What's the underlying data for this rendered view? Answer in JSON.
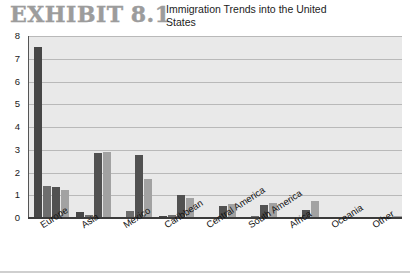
{
  "header": {
    "exhibit_label": "EXHIBIT",
    "exhibit_number": "8.1",
    "title": "Immigration Trends into the United States"
  },
  "colors": {
    "series_1900_1909": "#474747",
    "series_1950_1959": "#6e6e6e",
    "series_1990_1999": "#515151",
    "series_2000_2010": "#a2a2a2",
    "plot_background": "#e9e9e9",
    "gridline": "#b9b9b9",
    "axis": "#3b3b3b",
    "exhibit_label_color": "#9c9c9c"
  },
  "chart_data": {
    "type": "bar",
    "title": "Immigration Trends into the United States",
    "xlabel": "",
    "ylabel": "",
    "ylim": [
      0,
      8
    ],
    "yticks": [
      "0",
      "1",
      "2",
      "3",
      "4",
      "5",
      "6",
      "7",
      "8"
    ],
    "grid": true,
    "legend_position": "top-right",
    "categories": [
      "Europe",
      "Asia",
      "Mexico",
      "Caribbean",
      "Central America",
      "South America",
      "Africa",
      "Oceania",
      "Other"
    ],
    "series": [
      {
        "name": "1900–1909",
        "color": "#474747",
        "values": [
          7.5,
          0.25,
          0.03,
          0.1,
          0.02,
          0.02,
          0.01,
          0.01,
          0.02
        ]
      },
      {
        "name": "1950–1959",
        "color": "#6e6e6e",
        "values": [
          1.4,
          0.15,
          0.3,
          0.12,
          0.04,
          0.08,
          0.01,
          0.01,
          0.02
        ]
      },
      {
        "name": "1990–1999",
        "color": "#515151",
        "values": [
          1.35,
          2.85,
          2.75,
          1.0,
          0.55,
          0.57,
          0.35,
          0.04,
          0.06
        ]
      },
      {
        "name": "2000–2010",
        "color": "#a2a2a2",
        "values": [
          1.25,
          2.9,
          1.7,
          0.9,
          0.6,
          0.64,
          0.76,
          0.05,
          0.1
        ]
      }
    ]
  },
  "legend": {
    "entries": [
      {
        "label": "1900–1909",
        "color": "#474747"
      },
      {
        "label": "1990–1999",
        "color": "#515151"
      },
      {
        "label": "1950–1959",
        "color": "#6e6e6e"
      },
      {
        "label": "2000–2010",
        "color": "#a2a2a2"
      }
    ]
  }
}
